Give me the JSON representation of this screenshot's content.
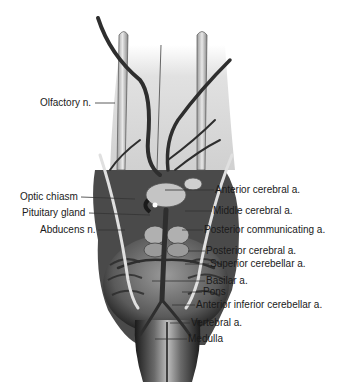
{
  "diagram": {
    "labels": [
      {
        "id": "olfactory",
        "text": "Olfactory n.",
        "side": "left",
        "x": 40,
        "y": 97,
        "line": [
          95,
          103,
          115,
          103
        ]
      },
      {
        "id": "optic-chiasm",
        "text": "Optic chiasm",
        "side": "left",
        "x": 20,
        "y": 191,
        "line": [
          81,
          197,
          135,
          199
        ]
      },
      {
        "id": "pituitary",
        "text": "Pituitary gland",
        "side": "left",
        "x": 22,
        "y": 207,
        "line": [
          89,
          213,
          150,
          215
        ]
      },
      {
        "id": "abducens",
        "text": "Abducens n.",
        "side": "left",
        "x": 40,
        "y": 224,
        "line": [
          98,
          230,
          125,
          230
        ]
      },
      {
        "id": "anterior-cerebral",
        "text": "Anterior cerebral a.",
        "side": "right",
        "x": 215,
        "y": 184,
        "line": [
          165,
          190,
          214,
          190
        ]
      },
      {
        "id": "middle-cerebral",
        "text": "Middle cerebral a.",
        "side": "right",
        "x": 213,
        "y": 205,
        "line": [
          185,
          211,
          212,
          211
        ]
      },
      {
        "id": "posterior-communicating",
        "text": "Posterior communicating a.",
        "side": "right",
        "x": 204,
        "y": 224,
        "line": [
          182,
          230,
          203,
          230
        ]
      },
      {
        "id": "posterior-cerebral",
        "text": "Posterior cerebral a.",
        "side": "right",
        "x": 206,
        "y": 245,
        "line": [
          188,
          251,
          205,
          251
        ]
      },
      {
        "id": "superior-cerebellar",
        "text": "Superior cerebellar a.",
        "side": "right",
        "x": 210,
        "y": 258,
        "line": [
          185,
          264,
          209,
          264
        ]
      },
      {
        "id": "basilar",
        "text": "Basilar a.",
        "side": "right",
        "x": 206,
        "y": 275,
        "line": [
          152,
          281,
          205,
          281
        ]
      },
      {
        "id": "pons",
        "text": "Pons",
        "side": "right",
        "x": 203,
        "y": 286,
        "line": [
          182,
          292,
          202,
          292
        ]
      },
      {
        "id": "anterior-inferior-cerebellar",
        "text": "Anterior inferior cerebellar a.",
        "side": "right",
        "x": 196,
        "y": 299,
        "line": [
          172,
          305,
          195,
          305
        ]
      },
      {
        "id": "vertebral",
        "text": "Vertebral a.",
        "side": "right",
        "x": 191,
        "y": 317,
        "line": [
          170,
          323,
          190,
          323
        ]
      },
      {
        "id": "medulla",
        "text": "Medulla",
        "side": "right",
        "x": 188,
        "y": 333,
        "line": [
          155,
          339,
          187,
          339
        ]
      }
    ],
    "colors": {
      "background": "#ffffff",
      "text": "#1a1a1a",
      "leader_line": "#333333",
      "tissue_light": "#d9d9d9",
      "tissue_mid": "#8a8a8a",
      "tissue_dark": "#2a2a2a",
      "vessel": "#3a3a3a"
    }
  }
}
